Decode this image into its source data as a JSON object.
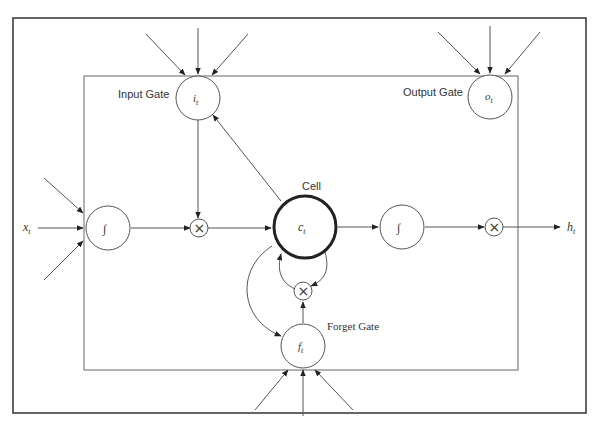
{
  "diagram": {
    "labels": {
      "input_gate": "Input Gate",
      "output_gate": "Output Gate",
      "forget_gate": "Forget Gate",
      "cell": "Cell"
    },
    "symbols": {
      "input_gate": "i",
      "output_gate": "o",
      "forget_gate": "f",
      "cell": "c",
      "input": "x",
      "output": "h",
      "subscript": "t",
      "sigmoid": "∫",
      "multiply": "×"
    },
    "nodes": [
      {
        "id": "input_gate",
        "type": "gate",
        "symbol": "i_t"
      },
      {
        "id": "output_gate",
        "type": "gate",
        "symbol": "o_t"
      },
      {
        "id": "forget_gate",
        "type": "gate",
        "symbol": "f_t"
      },
      {
        "id": "cell",
        "type": "cell",
        "symbol": "c_t"
      },
      {
        "id": "input_squash",
        "type": "activation"
      },
      {
        "id": "output_squash",
        "type": "activation"
      },
      {
        "id": "mul_input",
        "type": "multiply"
      },
      {
        "id": "mul_forget",
        "type": "multiply"
      },
      {
        "id": "mul_output",
        "type": "multiply"
      }
    ],
    "edges": [
      [
        "x_t",
        "input_squash"
      ],
      [
        "input_squash",
        "mul_input"
      ],
      [
        "input_gate",
        "mul_input"
      ],
      [
        "mul_input",
        "cell"
      ],
      [
        "cell",
        "input_gate"
      ],
      [
        "cell",
        "output_squash"
      ],
      [
        "output_squash",
        "mul_output"
      ],
      [
        "mul_output",
        "h_t"
      ],
      [
        "cell",
        "mul_forget"
      ],
      [
        "mul_forget",
        "cell"
      ],
      [
        "forget_gate",
        "mul_forget"
      ],
      [
        "cell",
        "forget_gate"
      ]
    ]
  }
}
